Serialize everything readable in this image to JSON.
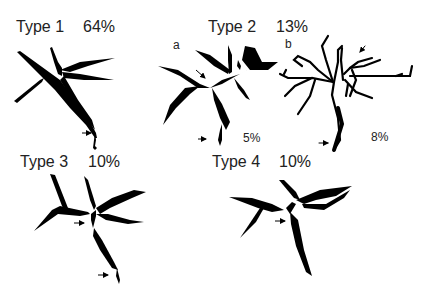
{
  "figure": {
    "panels": [
      {
        "id": "type1",
        "title": "Type 1",
        "percent": "64%"
      },
      {
        "id": "type2",
        "title": "Type 2",
        "percent": "13%",
        "subpanels": [
          {
            "label": "a",
            "percent": "5%"
          },
          {
            "label": "b",
            "percent": "8%"
          }
        ]
      },
      {
        "id": "type3",
        "title": "Type 3",
        "percent": "10%"
      },
      {
        "id": "type4",
        "title": "Type 4",
        "percent": "10%"
      }
    ],
    "colors": {
      "ink": "#000000",
      "text": "#222222",
      "background": "#ffffff"
    }
  }
}
